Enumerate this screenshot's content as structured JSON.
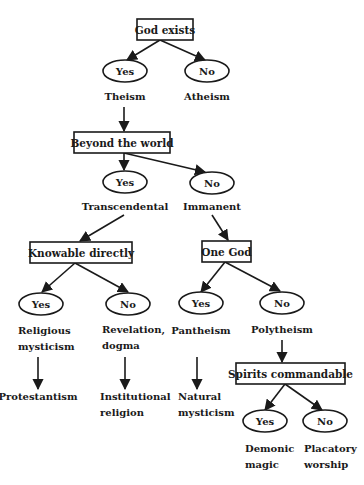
{
  "diagram": {
    "type": "decision-tree",
    "colors": {
      "stroke": "#1a1a1a",
      "background": "#ffffff"
    },
    "questions": {
      "god_exists": "God exists",
      "beyond_world": "Beyond the world",
      "knowable": "Knowable directly",
      "one_god": "One God",
      "spirits": "Spirits commandable"
    },
    "answers": {
      "yes": "Yes",
      "no": "No"
    },
    "outcomes": {
      "theism": [
        "Theism"
      ],
      "atheism": [
        "Atheism"
      ],
      "transcendental": [
        "Transcendental"
      ],
      "immanent": [
        "Immanent"
      ],
      "religious_mysticism": [
        "Religious",
        "mysticism"
      ],
      "revelation": [
        "Revelation,",
        "dogma"
      ],
      "pantheism": [
        "Pantheism"
      ],
      "polytheism": [
        "Polytheism"
      ],
      "protestantism": [
        "Protestantism"
      ],
      "institutional": [
        "Institutional",
        "religion"
      ],
      "natural_mysticism": [
        "Natural",
        "mysticism"
      ],
      "demonic_magic": [
        "Demonic",
        "magic"
      ],
      "placatory_worship": [
        "Placatory",
        "worship"
      ]
    }
  }
}
